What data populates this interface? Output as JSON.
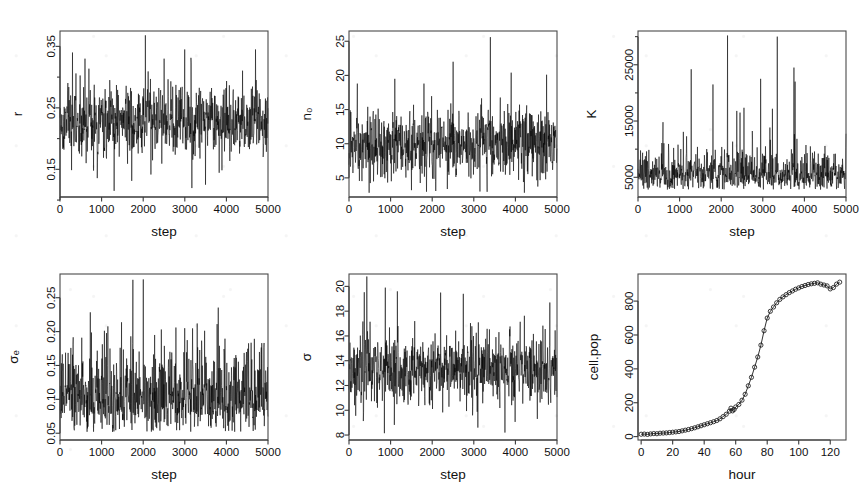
{
  "figure": {
    "kind": "multi-panel-trace-plot",
    "rows": 2,
    "cols": 3,
    "background": "#ffffff",
    "line_color": "#000000"
  },
  "chart_data": [
    {
      "id": "panel-r",
      "type": "line",
      "title": "",
      "xlabel": "step",
      "ylabel": "r",
      "xlim": [
        0,
        5000
      ],
      "ylim": [
        0.105,
        0.375
      ],
      "xticks": [
        0,
        1000,
        2000,
        3000,
        4000,
        5000
      ],
      "xticklabels": [
        "0",
        "1000",
        "2000",
        "3000",
        "4000",
        "5000"
      ],
      "yticks": [
        0.15,
        0.25,
        0.35
      ],
      "yticklabels": [
        "0.15",
        "0.25",
        "0.35"
      ],
      "yminorticks": [
        0.1,
        0.2,
        0.3
      ],
      "grid": false,
      "legend": false,
      "series_description": "MCMC trace of growth-rate parameter r over 5000 steps; mean about 0.225, dense band 0.18-0.27, occasional spikes to 0.365 near step 2000 and dips to 0.115 near step 1300",
      "mean": 0.225,
      "min": 0.115,
      "max": 0.368,
      "n_points": 5000
    },
    {
      "id": "panel-n0",
      "type": "line",
      "title": "",
      "xlabel": "step",
      "ylabel": "n0",
      "ylabel_display": "n₀",
      "xlim": [
        0,
        5000
      ],
      "ylim": [
        2.2,
        26.5
      ],
      "xticks": [
        0,
        1000,
        2000,
        3000,
        4000,
        5000
      ],
      "xticklabels": [
        "0",
        "1000",
        "2000",
        "3000",
        "4000",
        "5000"
      ],
      "yticks": [
        5,
        10,
        15,
        20,
        25
      ],
      "yticklabels": [
        "5",
        "10",
        "15",
        "20",
        "25"
      ],
      "grid": false,
      "legend": false,
      "series_description": "MCMC trace of initial population n0; mean about 10, dense band 6-14, spikes to 25.5 near step 3400 and 22 near step 2500",
      "mean": 10,
      "min": 2.6,
      "max": 25.6,
      "n_points": 5000
    },
    {
      "id": "panel-K",
      "type": "line",
      "title": "",
      "xlabel": "step",
      "ylabel": "K",
      "xlim": [
        0,
        5000
      ],
      "ylim": [
        1500,
        31000
      ],
      "xticks": [
        0,
        1000,
        2000,
        3000,
        4000,
        5000
      ],
      "xticklabels": [
        "0",
        "1000",
        "2000",
        "3000",
        "4000",
        "5000"
      ],
      "yticks": [
        5000,
        15000,
        25000
      ],
      "yticklabels": [
        "5000",
        "15000",
        "25000"
      ],
      "yminorticks": [
        10000,
        20000,
        30000
      ],
      "grid": false,
      "legend": false,
      "series_description": "MCMC trace of carrying capacity K; dense band 3000-8000 with heavy right tail, tall spikes to about 30000 near steps 2150 and 3350, and to 24000 near steps 1280 and 3750",
      "mean": 5600,
      "min": 2800,
      "max": 30200,
      "n_points": 5000
    },
    {
      "id": "panel-sigma-b",
      "type": "line",
      "title": "",
      "xlabel": "step",
      "ylabel": "sigma_b",
      "ylabel_display": "σₑ",
      "xlim": [
        0,
        5000
      ],
      "ylim": [
        0.04,
        0.285
      ],
      "xticks": [
        0,
        1000,
        2000,
        3000,
        4000,
        5000
      ],
      "xticklabels": [
        "0",
        "1000",
        "2000",
        "3000",
        "4000",
        "5000"
      ],
      "yticks": [
        0.05,
        0.1,
        0.15,
        0.2,
        0.25
      ],
      "yticklabels": [
        "0.05",
        "0.10",
        "0.15",
        "0.20",
        "0.25"
      ],
      "grid": false,
      "legend": false,
      "series_description": "MCMC trace of process noise sigma_b; mean about 0.105, dense band 0.07-0.14, single tall spike to 0.275 near step 2000 and several to 0.21 near steps 3300 and 3750",
      "mean": 0.105,
      "min": 0.052,
      "max": 0.277,
      "n_points": 5000
    },
    {
      "id": "panel-sigma",
      "type": "line",
      "title": "",
      "xlabel": "step",
      "ylabel": "sigma",
      "ylabel_display": "σ",
      "xlim": [
        0,
        5000
      ],
      "ylim": [
        7.6,
        21.0
      ],
      "xticks": [
        0,
        1000,
        2000,
        3000,
        4000,
        5000
      ],
      "xticklabels": [
        "0",
        "1000",
        "2000",
        "3000",
        "4000",
        "5000"
      ],
      "yticks": [
        8,
        10,
        12,
        14,
        16,
        18,
        20
      ],
      "yticklabels": [
        "8",
        "10",
        "12",
        "14",
        "16",
        "18",
        "20"
      ],
      "grid": false,
      "legend": false,
      "series_description": "MCMC trace of observation noise sigma; mean about 13.3, dense band 11.5-15, peaks to 20.8 near step 430 and dips to 8.1 near steps 850 and 3750",
      "mean": 13.3,
      "min": 8.1,
      "max": 20.8,
      "n_points": 5000
    },
    {
      "id": "panel-cellpop",
      "type": "scatter",
      "title": "",
      "xlabel": "hour",
      "ylabel": "cell.pop",
      "xlim": [
        -2,
        130
      ],
      "ylim": [
        -20,
        960
      ],
      "xticks": [
        0,
        20,
        40,
        60,
        80,
        100,
        120
      ],
      "xticklabels": [
        "0",
        "20",
        "40",
        "60",
        "80",
        "100",
        "120"
      ],
      "yticks": [
        0,
        200,
        400,
        600,
        800
      ],
      "yticklabels": [
        "0",
        "200",
        "400",
        "600",
        "800"
      ],
      "grid": false,
      "legend": false,
      "marker": "open-circle",
      "line_through_points": true,
      "series_description": "Logistic (sigmoid) cell population growth vs hour, with open-circle observations joined by a line; slow rise to about 150 by hour 58, steep inflection near hour 72-78, plateau near 900 after hour 105, small dip and recovery near hour 122",
      "x": [
        0,
        2,
        4,
        6,
        8,
        10,
        12,
        14,
        16,
        18,
        20,
        22,
        24,
        26,
        28,
        30,
        32,
        34,
        36,
        38,
        40,
        42,
        44,
        46,
        48,
        50,
        52,
        54,
        56,
        57,
        58,
        59,
        60,
        62,
        64,
        66,
        68,
        70,
        72,
        74,
        76,
        78,
        80,
        82,
        84,
        86,
        88,
        90,
        92,
        94,
        96,
        98,
        100,
        102,
        104,
        106,
        108,
        110,
        112,
        114,
        116,
        118,
        120,
        122,
        124,
        126
      ],
      "y": [
        14,
        15,
        13,
        16,
        18,
        17,
        20,
        21,
        22,
        24,
        26,
        28,
        30,
        34,
        38,
        42,
        47,
        52,
        58,
        64,
        70,
        76,
        82,
        88,
        95,
        105,
        118,
        132,
        150,
        168,
        152,
        160,
        175,
        190,
        215,
        250,
        300,
        350,
        410,
        470,
        540,
        625,
        700,
        740,
        765,
        790,
        810,
        825,
        838,
        850,
        860,
        870,
        878,
        886,
        892,
        898,
        902,
        905,
        908,
        900,
        895,
        890,
        872,
        880,
        900,
        912
      ]
    }
  ]
}
